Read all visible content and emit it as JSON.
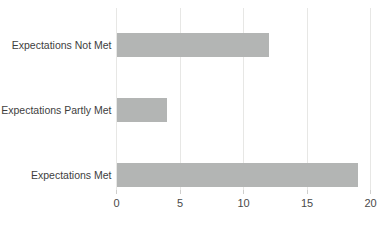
{
  "chart_data": {
    "type": "bar",
    "orientation": "horizontal",
    "title": "",
    "xlabel": "",
    "ylabel": "",
    "categories": [
      "Expectations Not Met",
      "Expectations Partly Met",
      "Expectations Met"
    ],
    "values": [
      12,
      4,
      19
    ],
    "xlim": [
      0,
      20
    ],
    "xticks": [
      0,
      5,
      10,
      15,
      20
    ],
    "grid": true,
    "legend": false,
    "colors": {
      "bar": "#b3b5b4",
      "gridline": "#e7e7e5",
      "tick_mark": "#cfcfcd",
      "tick_label": "#4a4a4a",
      "category_label": "#3e3e3e",
      "background": "#ffffff"
    }
  }
}
